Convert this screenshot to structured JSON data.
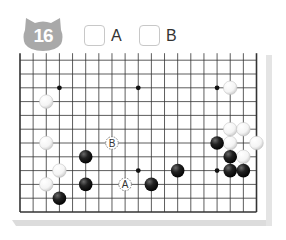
{
  "problem": {
    "number": "16",
    "badge_color": "#a9a9a9"
  },
  "choices": [
    {
      "id": "A",
      "label": "A",
      "checked": false
    },
    {
      "id": "B",
      "label": "B",
      "checked": false
    }
  ],
  "board": {
    "size": 19,
    "visible_rows_from_bottom": 12,
    "line_color": "#333333",
    "hoshi": [
      {
        "col": 3,
        "row": 9
      },
      {
        "col": 9,
        "row": 9
      },
      {
        "col": 15,
        "row": 9
      },
      {
        "col": 9,
        "row": 3
      },
      {
        "col": 15,
        "row": 3
      }
    ],
    "black_stones": [
      {
        "col": 5,
        "row": 4
      },
      {
        "col": 5,
        "row": 2
      },
      {
        "col": 3,
        "row": 1
      },
      {
        "col": 10,
        "row": 2
      },
      {
        "col": 12,
        "row": 3
      },
      {
        "col": 15,
        "row": 5
      },
      {
        "col": 16,
        "row": 4
      },
      {
        "col": 16,
        "row": 3
      },
      {
        "col": 17,
        "row": 3
      }
    ],
    "white_stones": [
      {
        "col": 2,
        "row": 8
      },
      {
        "col": 2,
        "row": 5
      },
      {
        "col": 3,
        "row": 3
      },
      {
        "col": 2,
        "row": 2
      },
      {
        "col": 16,
        "row": 9
      },
      {
        "col": 16,
        "row": 6
      },
      {
        "col": 17,
        "row": 6
      },
      {
        "col": 16,
        "row": 5
      },
      {
        "col": 18,
        "row": 5
      },
      {
        "col": 17,
        "row": 4
      }
    ],
    "markers": [
      {
        "label": "A",
        "col": 8,
        "row": 2
      },
      {
        "label": "B",
        "col": 7,
        "row": 5
      }
    ]
  }
}
